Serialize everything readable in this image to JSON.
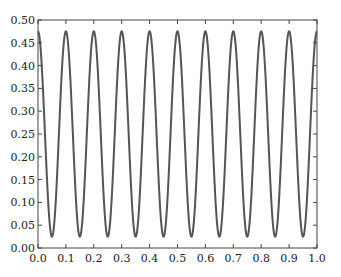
{
  "chart_data": {
    "type": "line",
    "title": "",
    "xlabel": "",
    "ylabel": "",
    "xlim": [
      0.0,
      1.0
    ],
    "ylim": [
      0.0,
      0.5
    ],
    "grid": false,
    "legend": null,
    "x_ticks": [
      "0.0",
      "0.1",
      "0.2",
      "0.3",
      "0.4",
      "0.5",
      "0.6",
      "0.7",
      "0.8",
      "0.9",
      "1.0"
    ],
    "y_ticks": [
      "0.00",
      "0.05",
      "0.10",
      "0.15",
      "0.20",
      "0.25",
      "0.30",
      "0.35",
      "0.40",
      "0.45",
      "0.50"
    ],
    "series": [
      {
        "name": "signal",
        "color": "#555555",
        "function": "0.25 + 0.225*cos(2*pi*10*x)",
        "frequency": 10,
        "mean": 0.25,
        "amplitude": 0.225,
        "peak_value": 0.475,
        "trough_value": 0.025,
        "peaks_x": [
          0.0,
          0.1,
          0.2,
          0.3,
          0.4,
          0.5,
          0.6,
          0.7,
          0.8,
          0.9,
          1.0
        ],
        "troughs_x": [
          0.05,
          0.15,
          0.25,
          0.35,
          0.45,
          0.55,
          0.65,
          0.75,
          0.85,
          0.95
        ]
      }
    ]
  }
}
